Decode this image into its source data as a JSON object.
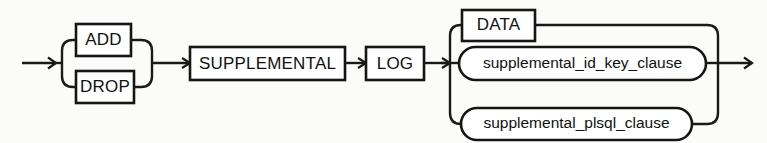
{
  "diagram": {
    "type": "railroad-syntax-diagram",
    "name": "supplemental_log_clause",
    "background_color": "#fbfbf9",
    "stroke_color": "#151515",
    "fill_color": "#ffffff",
    "entry_arrow": "arrow-right",
    "exit_arrow": "arrow-right",
    "nodes": {
      "add": {
        "label": "ADD",
        "shape": "rectangle",
        "kind": "keyword"
      },
      "drop": {
        "label": "DROP",
        "shape": "rectangle",
        "kind": "keyword"
      },
      "supplemental": {
        "label": "SUPPLEMENTAL",
        "shape": "rectangle",
        "kind": "keyword"
      },
      "log": {
        "label": "LOG",
        "shape": "rectangle",
        "kind": "keyword"
      },
      "data": {
        "label": "DATA",
        "shape": "rectangle",
        "kind": "keyword"
      },
      "id_key_clause": {
        "label": "supplemental_id_key_clause",
        "shape": "rounded",
        "kind": "nonterminal"
      },
      "plsql_clause": {
        "label": "supplemental_plsql_clause",
        "shape": "rounded",
        "kind": "nonterminal"
      }
    },
    "alternation_groups": [
      {
        "name": "add-drop-group",
        "options": [
          "ADD",
          "DROP"
        ]
      },
      {
        "name": "log-target-group",
        "options": [
          "DATA",
          "supplemental_id_key_clause",
          "supplemental_plsql_clause"
        ]
      }
    ],
    "sequence": [
      "add-drop-group",
      "SUPPLEMENTAL",
      "LOG",
      "log-target-group"
    ]
  }
}
